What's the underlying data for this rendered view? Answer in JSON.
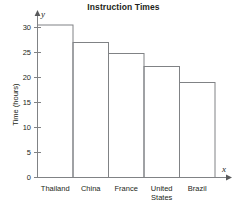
{
  "chart_data": {
    "type": "bar",
    "title": "Instruction Times",
    "xlabel": "",
    "ylabel": "Time (hours)",
    "categories": [
      "Thailand",
      "China",
      "France",
      "United States",
      "Brazil"
    ],
    "category_lines": [
      [
        "Thailand"
      ],
      [
        "China"
      ],
      [
        "France"
      ],
      [
        "United",
        "States"
      ],
      [
        "Brazil"
      ]
    ],
    "values": [
      30.5,
      27,
      24.8,
      22.2,
      19
    ],
    "ylim": [
      0,
      32
    ],
    "yticks": [
      0,
      5,
      10,
      15,
      20,
      25,
      30
    ],
    "ytick_labels": [
      "0",
      "5",
      "10",
      "15",
      "20",
      "25",
      "30"
    ],
    "grid": false,
    "legend": null,
    "x_axis_variable": "x",
    "y_axis_variable": "y",
    "bar_fill": "#ffffff",
    "bar_stroke": "#808285",
    "axis_color": "#808285",
    "text_color": "#231f20"
  }
}
